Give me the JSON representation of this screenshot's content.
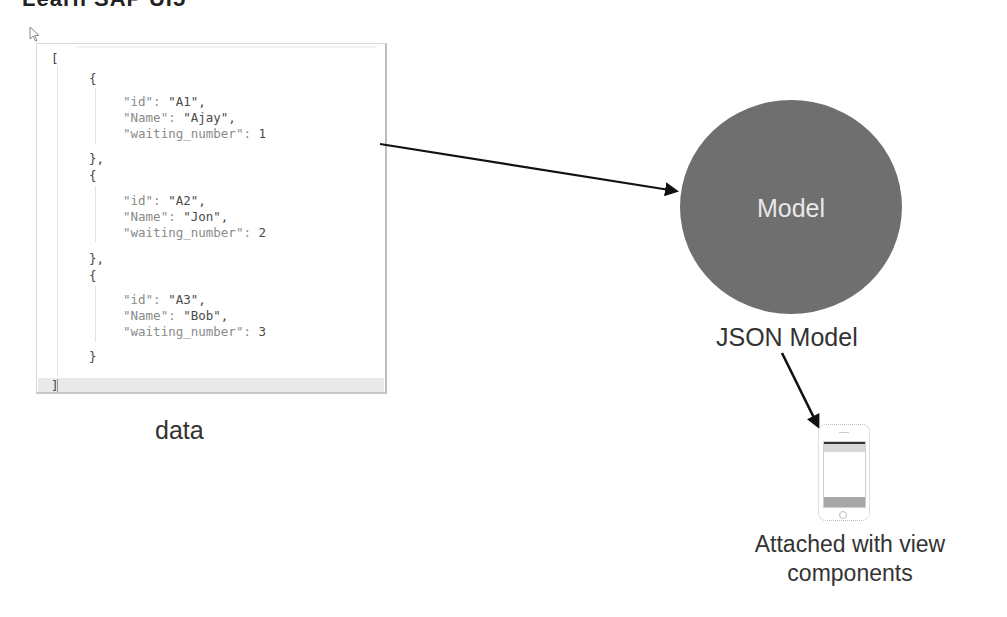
{
  "header": {
    "title": "Learn SAP UI5"
  },
  "code_panel": {
    "lines": [
      {
        "text": "[",
        "x": 14,
        "y": 7
      },
      {
        "text": "{",
        "x": 52,
        "y": 27
      },
      {
        "key": "\"id\"",
        "sep": ": ",
        "val": "\"A1\",",
        "x": 86,
        "y": 50
      },
      {
        "key": "\"Name\"",
        "sep": ": ",
        "val": "\"Ajay\",",
        "x": 86,
        "y": 66
      },
      {
        "key": "\"waiting_number\"",
        "sep": ": ",
        "val": "1",
        "x": 86,
        "y": 82
      },
      {
        "text": "},",
        "x": 52,
        "y": 107
      },
      {
        "text": "{",
        "x": 52,
        "y": 124
      },
      {
        "key": "\"id\"",
        "sep": ": ",
        "val": "\"A2\",",
        "x": 86,
        "y": 149
      },
      {
        "key": "\"Name\"",
        "sep": ": ",
        "val": "\"Jon\",",
        "x": 86,
        "y": 165
      },
      {
        "key": "\"waiting_number\"",
        "sep": ": ",
        "val": "2",
        "x": 86,
        "y": 181
      },
      {
        "text": "},",
        "x": 52,
        "y": 207
      },
      {
        "text": "{",
        "x": 52,
        "y": 224
      },
      {
        "key": "\"id\"",
        "sep": ": ",
        "val": "\"A3\",",
        "x": 86,
        "y": 248
      },
      {
        "key": "\"Name\"",
        "sep": ": ",
        "val": "\"Bob\",",
        "x": 86,
        "y": 264
      },
      {
        "key": "\"waiting_number\"",
        "sep": ": ",
        "val": "3",
        "x": 86,
        "y": 280
      },
      {
        "text": "}",
        "x": 52,
        "y": 305
      },
      {
        "text": "]",
        "x": 14,
        "y": 334
      }
    ],
    "records": [
      {
        "id": "A1",
        "Name": "Ajay",
        "waiting_number": 1
      },
      {
        "id": "A2",
        "Name": "Jon",
        "waiting_number": 2
      },
      {
        "id": "A3",
        "Name": "Bob",
        "waiting_number": 3
      }
    ]
  },
  "labels": {
    "data": "data",
    "model": "Model",
    "json_model": "JSON Model",
    "attached_line1": "Attached with view",
    "attached_line2": "components"
  },
  "colors": {
    "model_circle": "#6f6f6f",
    "arrow": "#111111",
    "text": "#333333"
  }
}
